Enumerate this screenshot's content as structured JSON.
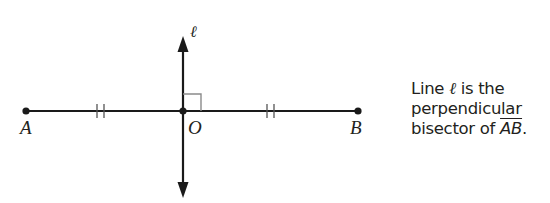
{
  "heading_fragment": "A P",
  "diagram": {
    "line_label": "ℓ",
    "points": [
      {
        "name": "A",
        "x": 26,
        "y": 111
      },
      {
        "name": "O",
        "x": 183,
        "y": 111
      },
      {
        "name": "B",
        "x": 358,
        "y": 111
      }
    ],
    "labels": {
      "A": "A",
      "O": "O",
      "B": "B"
    },
    "segment": "AB",
    "congruence_ticks": "double tick marks on AO and OB",
    "right_angle_marker": "at O",
    "colors": {
      "line": "#1a1a1a",
      "right_angle_box": "#8a8a8a"
    }
  },
  "caption": {
    "line1_prefix": "Line ",
    "line1_symbol": "ℓ",
    "line1_suffix": " is the",
    "line2": "perpendicular",
    "line3_prefix": "bisector of ",
    "line3_segment": "AB",
    "line3_suffix": "."
  }
}
